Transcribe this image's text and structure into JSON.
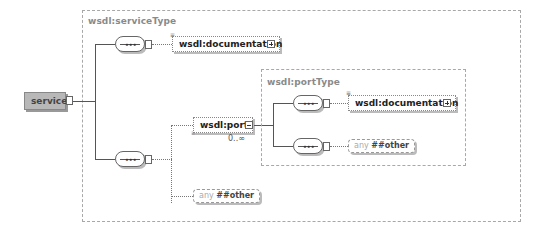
{
  "diagram": {
    "root": {
      "name": "service"
    },
    "service_type": {
      "label": "wsdl:serviceType",
      "children": [
        {
          "kind": "element",
          "name": "wsdl:documentation",
          "optional": true,
          "expandable": true
        },
        {
          "kind": "sequence",
          "children": [
            {
              "kind": "element",
              "name": "wsdl:port",
              "multiplicity": "0..∞",
              "expanded": true
            },
            {
              "kind": "any",
              "keyword": "any",
              "namespace": "##other"
            }
          ]
        }
      ]
    },
    "port_type": {
      "label": "wsdl:portType",
      "children": [
        {
          "kind": "element",
          "name": "wsdl:documentation",
          "optional": true,
          "expandable": true
        },
        {
          "kind": "any",
          "keyword": "any",
          "namespace": "##other"
        }
      ]
    },
    "colors": {
      "root_fill": "#b8b8b8",
      "line": "#555555",
      "type_border": "#a8a8a8",
      "type_label": "#8a8a8a"
    }
  }
}
